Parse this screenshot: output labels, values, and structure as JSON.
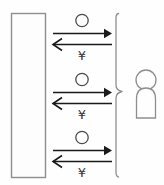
{
  "diagram": {
    "canvas": {
      "width": 164,
      "height": 185
    },
    "colors": {
      "line": "#1a1a1a",
      "outline": "#8e8e8e",
      "fill": "#fdfdfd",
      "glyph": "#3a3a3a",
      "background": "#ffffff"
    },
    "supplier": {
      "label": "",
      "shape": "tall-rectangle",
      "x": 11,
      "y": 13,
      "width": 35,
      "height": 165
    },
    "exchanges": [
      {
        "index": 1,
        "goods_symbol": "○",
        "money_symbol": "¥",
        "outbound_direction": "right",
        "inbound_direction": "left",
        "y": 14
      },
      {
        "index": 2,
        "goods_symbol": "○",
        "money_symbol": "¥",
        "outbound_direction": "right",
        "inbound_direction": "left",
        "y": 73
      },
      {
        "index": 3,
        "goods_symbol": "○",
        "money_symbol": "¥",
        "outbound_direction": "right",
        "inbound_direction": "left",
        "y": 131
      }
    ],
    "grouping_brace": {
      "label": "",
      "orientation": "right-facing",
      "x": 116,
      "top": 13,
      "bottom": 177
    },
    "customer": {
      "label": "",
      "shape": "person",
      "head_cx": 146,
      "head_cy": 80,
      "head_r": 10,
      "body_x": 136,
      "body_y": 88,
      "body_width": 20,
      "body_height": 30
    }
  }
}
